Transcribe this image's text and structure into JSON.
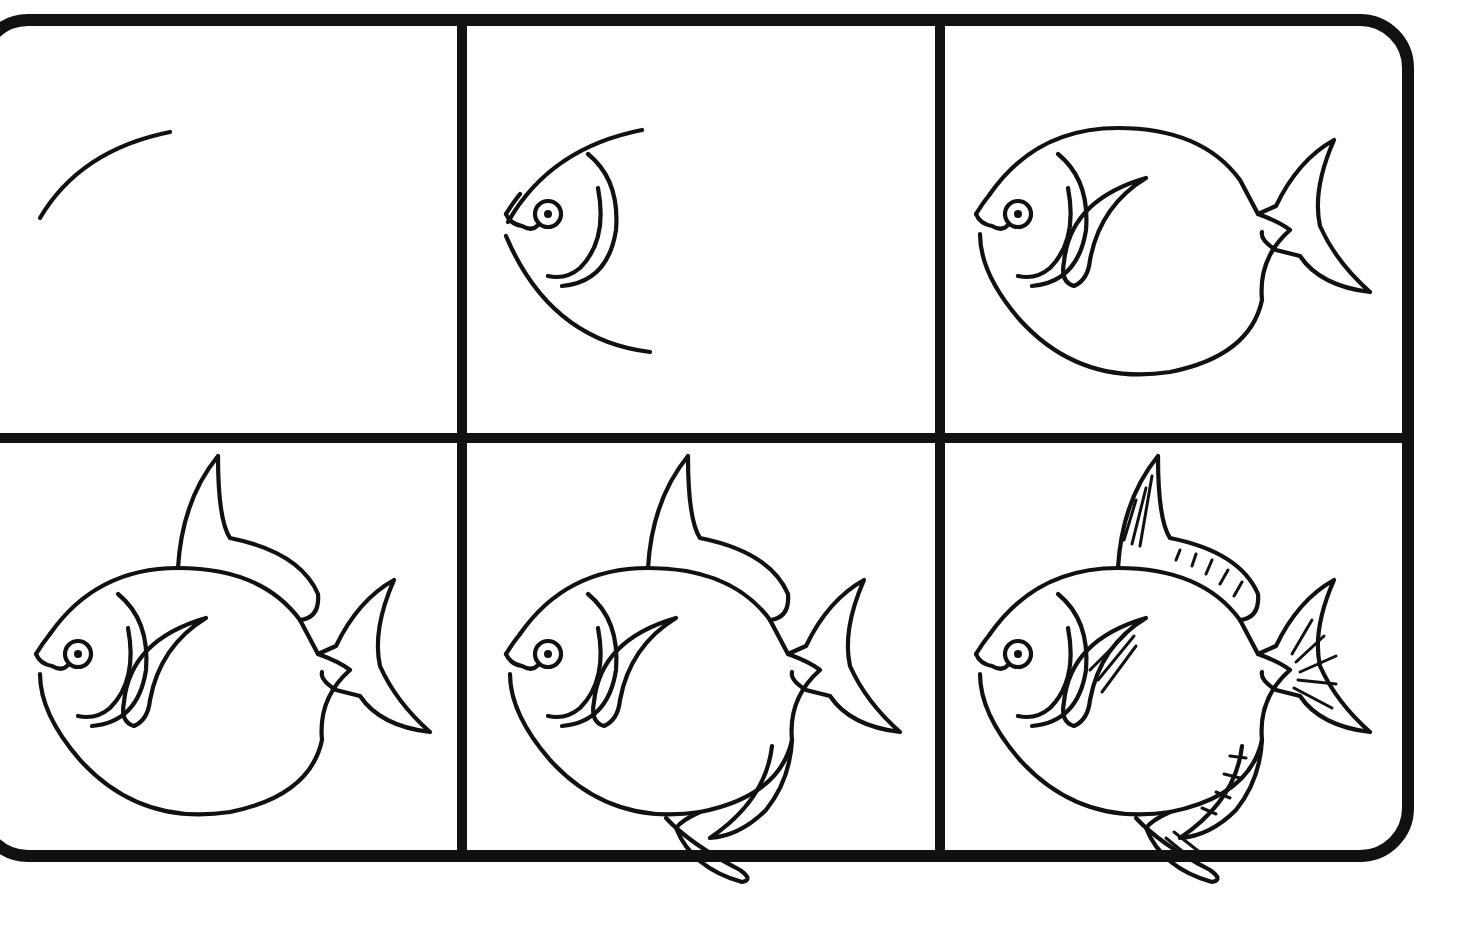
{
  "colors": {
    "ink": "#111111",
    "paper": "#ffffff"
  },
  "grid": {
    "rows": 2,
    "cols": 3
  },
  "panels": [
    {
      "step": 1,
      "description": "Curved line for the top of the head",
      "parts": [
        "head-arc"
      ]
    },
    {
      "step": 2,
      "description": "Face with eye, mouth, gill lines and lower jaw curve",
      "parts": [
        "head-arc",
        "face"
      ]
    },
    {
      "step": 3,
      "description": "Round body, pectoral fin and tail",
      "parts": [
        "face",
        "body",
        "pectoral-fin",
        "tail"
      ]
    },
    {
      "step": 4,
      "description": "Add dorsal fin along the back",
      "parts": [
        "face",
        "body",
        "pectoral-fin",
        "tail",
        "dorsal-fin"
      ]
    },
    {
      "step": 5,
      "description": "Add anal fin and pelvic fin below",
      "parts": [
        "face",
        "body",
        "pectoral-fin",
        "tail",
        "dorsal-fin",
        "anal-fin",
        "pelvic-fin"
      ]
    },
    {
      "step": 6,
      "description": "Add fin ray detail lines",
      "parts": [
        "face",
        "body",
        "pectoral-fin",
        "tail",
        "dorsal-fin",
        "anal-fin",
        "pelvic-fin",
        "fin-rays"
      ]
    }
  ]
}
